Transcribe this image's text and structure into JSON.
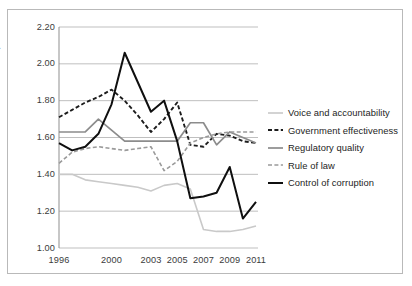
{
  "chart_data": {
    "type": "line",
    "title": "",
    "xlabel": "",
    "ylabel": "Maximum 2.5; minimum −2.5",
    "x": [
      1996,
      2000,
      2003,
      2005,
      2007,
      2009,
      2011
    ],
    "x_tick_labels": [
      "1996",
      "2000",
      "2003",
      "2005",
      "2007",
      "2009",
      "2011"
    ],
    "y_tick_labels": [
      "2.20",
      "2.00",
      "1.80",
      "1.60",
      "1.40",
      "1.20",
      "1.00"
    ],
    "y_ticks": [
      2.2,
      2.0,
      1.8,
      1.6,
      1.4,
      1.2,
      1.0
    ],
    "ylim": [
      1.0,
      2.2
    ],
    "xlim": [
      1996,
      2011
    ],
    "grid": "horizontal",
    "legend_position": "right",
    "series": [
      {
        "name": "Voice and accountability",
        "style": "solid",
        "color": "#c9c9c9",
        "width": 1.6,
        "x": [
          1996,
          1997,
          1998,
          1999,
          2000,
          2001,
          2002,
          2003,
          2004,
          2005,
          2006,
          2007,
          2008,
          2009,
          2010,
          2011
        ],
        "values": [
          1.4,
          1.4,
          1.37,
          1.36,
          1.35,
          1.34,
          1.33,
          1.31,
          1.34,
          1.35,
          1.32,
          1.1,
          1.09,
          1.09,
          1.1,
          1.12
        ]
      },
      {
        "name": "Government effectiveness",
        "style": "dashed",
        "color": "#1c1c1c",
        "width": 1.9,
        "x": [
          1996,
          1997,
          1998,
          1999,
          2000,
          2001,
          2002,
          2003,
          2004,
          2005,
          2006,
          2007,
          2008,
          2009,
          2010,
          2011
        ],
        "values": [
          1.71,
          1.75,
          1.79,
          1.82,
          1.86,
          1.8,
          1.72,
          1.63,
          1.7,
          1.79,
          1.56,
          1.55,
          1.62,
          1.61,
          1.58,
          1.57
        ]
      },
      {
        "name": "Regulatory quality",
        "style": "solid",
        "color": "#8c8c8c",
        "width": 1.7,
        "x": [
          1996,
          1997,
          1998,
          1999,
          2000,
          2001,
          2002,
          2003,
          2004,
          2005,
          2006,
          2007,
          2008,
          2009,
          2010,
          2011
        ],
        "values": [
          1.63,
          1.63,
          1.63,
          1.7,
          1.64,
          1.58,
          1.58,
          1.58,
          1.58,
          1.58,
          1.68,
          1.68,
          1.56,
          1.63,
          1.6,
          1.57
        ]
      },
      {
        "name": "Rule of law",
        "style": "dashed",
        "color": "#9a9a9a",
        "width": 1.6,
        "x": [
          1996,
          1997,
          1998,
          1999,
          2000,
          2001,
          2002,
          2003,
          2004,
          2005,
          2006,
          2007,
          2008,
          2009,
          2010,
          2011
        ],
        "values": [
          1.46,
          1.52,
          1.54,
          1.55,
          1.54,
          1.53,
          1.54,
          1.55,
          1.42,
          1.47,
          1.57,
          1.6,
          1.62,
          1.63,
          1.63,
          1.63
        ]
      },
      {
        "name": "Control of corruption",
        "style": "solid",
        "color": "#0f0f0f",
        "width": 2.0,
        "x": [
          1996,
          1997,
          1998,
          1999,
          2000,
          2001,
          2002,
          2003,
          2004,
          2005,
          2006,
          2007,
          2008,
          2009,
          2010,
          2011
        ],
        "values": [
          1.57,
          1.53,
          1.55,
          1.62,
          1.78,
          2.06,
          1.9,
          1.74,
          1.8,
          1.58,
          1.27,
          1.28,
          1.3,
          1.44,
          1.16,
          1.25
        ]
      }
    ]
  },
  "legend": {
    "items": [
      {
        "label": "Voice and accountability"
      },
      {
        "label": "Government effectiveness"
      },
      {
        "label": "Regulatory quality"
      },
      {
        "label": "Rule of law"
      },
      {
        "label": "Control of corruption"
      }
    ]
  }
}
